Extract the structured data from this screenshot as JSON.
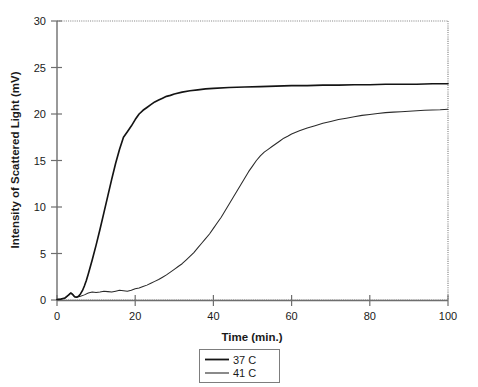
{
  "chart_data": {
    "type": "line",
    "title": "",
    "xlabel": "Time (min.)",
    "ylabel": "Intensity of Scattered Light (mV)",
    "xlim": [
      0,
      100
    ],
    "ylim": [
      0,
      30
    ],
    "xticks": [
      0,
      20,
      40,
      60,
      80,
      100
    ],
    "yticks": [
      0,
      5,
      10,
      15,
      20,
      25,
      30
    ],
    "xtick_labels": [
      "0",
      "20",
      "40",
      "60",
      "80",
      "100"
    ],
    "ytick_labels": [
      "0",
      "5",
      "10",
      "15",
      "20",
      "25",
      "30"
    ],
    "grid": false,
    "legend_position": "below-center",
    "legend_entries": [
      "37 C",
      "41 C"
    ],
    "series": [
      {
        "name": "37 C",
        "color": "#141414",
        "x": [
          0,
          1,
          2,
          3,
          3.5,
          4,
          4.5,
          5,
          5.5,
          6,
          6.5,
          7,
          7.5,
          8,
          9,
          10,
          11,
          12,
          13,
          14,
          15,
          16,
          17,
          18,
          19,
          20,
          21,
          22,
          23,
          24,
          25,
          26,
          27,
          28,
          29,
          30,
          32,
          34,
          36,
          38,
          40,
          44,
          48,
          52,
          56,
          60,
          64,
          68,
          72,
          76,
          80,
          84,
          88,
          92,
          96,
          100
        ],
        "y": [
          0.05,
          0.1,
          0.2,
          0.55,
          0.75,
          0.6,
          0.35,
          0.3,
          0.4,
          0.65,
          1.0,
          1.5,
          2.1,
          2.8,
          4.3,
          5.9,
          7.6,
          9.4,
          11.2,
          13.0,
          14.7,
          16.2,
          17.5,
          18.1,
          18.7,
          19.4,
          20.0,
          20.4,
          20.7,
          21.0,
          21.3,
          21.5,
          21.7,
          21.9,
          22.0,
          22.15,
          22.35,
          22.5,
          22.6,
          22.7,
          22.75,
          22.85,
          22.9,
          22.95,
          23.0,
          23.05,
          23.05,
          23.1,
          23.1,
          23.15,
          23.15,
          23.2,
          23.2,
          23.2,
          23.25,
          23.25
        ]
      },
      {
        "name": "41 C",
        "color": "#2a2a2a",
        "x": [
          0,
          1,
          2,
          3,
          3.5,
          4,
          4.5,
          5,
          6,
          7,
          8,
          9,
          10,
          11,
          12,
          13,
          14,
          15,
          16,
          17,
          18,
          19,
          20,
          21,
          22,
          23,
          24,
          25,
          26,
          27,
          28,
          29,
          30,
          31,
          32,
          33,
          34,
          35,
          36,
          37,
          38,
          39,
          40,
          41,
          42,
          43,
          44,
          45,
          46,
          47,
          48,
          49,
          50,
          51,
          52,
          53,
          54,
          55,
          56,
          57,
          58,
          59,
          60,
          62,
          64,
          66,
          68,
          70,
          72,
          74,
          76,
          78,
          80,
          82,
          84,
          86,
          88,
          90,
          92,
          94,
          96,
          98,
          100
        ],
        "y": [
          0.05,
          0.1,
          0.2,
          0.55,
          0.75,
          0.6,
          0.35,
          0.3,
          0.4,
          0.55,
          0.75,
          0.85,
          0.8,
          0.85,
          0.95,
          0.9,
          0.85,
          0.95,
          1.05,
          1.0,
          0.95,
          1.05,
          1.2,
          1.3,
          1.45,
          1.6,
          1.8,
          2.0,
          2.2,
          2.45,
          2.7,
          3.0,
          3.3,
          3.6,
          3.9,
          4.3,
          4.7,
          5.1,
          5.6,
          6.1,
          6.6,
          7.1,
          7.7,
          8.3,
          8.9,
          9.6,
          10.3,
          11.0,
          11.7,
          12.4,
          13.1,
          13.8,
          14.4,
          15.0,
          15.5,
          15.9,
          16.2,
          16.5,
          16.8,
          17.1,
          17.4,
          17.6,
          17.85,
          18.2,
          18.5,
          18.75,
          19.0,
          19.2,
          19.4,
          19.55,
          19.7,
          19.85,
          19.95,
          20.05,
          20.15,
          20.2,
          20.25,
          20.3,
          20.35,
          20.4,
          20.42,
          20.45,
          20.5
        ]
      }
    ]
  },
  "legend": {
    "items": [
      {
        "label": "37 C"
      },
      {
        "label": "41 C"
      }
    ]
  }
}
